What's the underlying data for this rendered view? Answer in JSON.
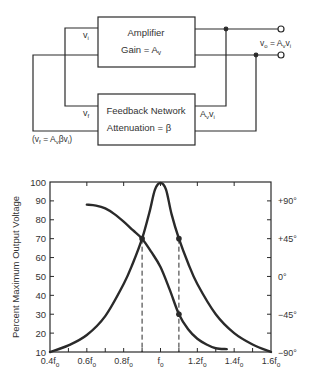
{
  "diagram": {
    "amplifier": {
      "title": "Amplifier",
      "subtitle_main": "Gain = A",
      "subtitle_sub": "v"
    },
    "feedback": {
      "title": "Feedback Network",
      "subtitle": "Attenuation = β"
    },
    "labels": {
      "vi": {
        "main": "v",
        "sub": "i"
      },
      "vf": {
        "main": "v",
        "sub": "f"
      },
      "output_parts": [
        "v",
        "o",
        " = A",
        "v",
        "v",
        "i"
      ],
      "feedback_output_parts": [
        "A",
        "v",
        "v",
        "i"
      ],
      "feedback_eq_parts": [
        "(v",
        "f",
        " = A",
        "v",
        "βv",
        "i",
        ")"
      ]
    }
  },
  "chart_data": {
    "type": "line",
    "title": "",
    "xlabel": "",
    "ylabel": "Percent Maximum Output Voltage",
    "y2label": "Phase",
    "categories": [
      "0.4f0",
      "0.6f0",
      "0.8f0",
      "f0",
      "1.2f0",
      "1.4f0",
      "1.6f0"
    ],
    "x_tick_labels": [
      {
        "main": "0.4f",
        "sub": "o"
      },
      {
        "main": "0.6f",
        "sub": "o"
      },
      {
        "main": "0.8f",
        "sub": "o"
      },
      {
        "main": "f",
        "sub": "o"
      },
      {
        "main": "1.2f",
        "sub": "o"
      },
      {
        "main": "1.4f",
        "sub": "o"
      },
      {
        "main": "1.6f",
        "sub": "o"
      }
    ],
    "x_ticks": [
      0.4,
      0.6,
      0.8,
      1.0,
      1.2,
      1.4,
      1.6
    ],
    "xlim": [
      0.4,
      1.6
    ],
    "ylim": [
      10,
      100
    ],
    "y_ticks": [
      10,
      20,
      30,
      40,
      50,
      60,
      70,
      80,
      90,
      100
    ],
    "y2_ticks": [
      {
        "value": 90,
        "label": "+90°"
      },
      {
        "value": 70,
        "label": "+45°"
      },
      {
        "value": 50,
        "label": "0°"
      },
      {
        "value": 30,
        "label": "−45°"
      },
      {
        "value": 10,
        "label": "−90°"
      }
    ],
    "grid": false,
    "series": [
      {
        "name": "Amplitude (% max output voltage)",
        "x": [
          0.4,
          0.5,
          0.6,
          0.7,
          0.8,
          0.85,
          0.9,
          0.94,
          0.97,
          1.0,
          1.03,
          1.06,
          1.1,
          1.15,
          1.2,
          1.3,
          1.4,
          1.5,
          1.6
        ],
        "values": [
          10,
          13.5,
          19,
          29,
          46,
          57,
          70,
          84,
          96,
          99.5,
          96,
          83,
          70,
          57,
          46,
          30,
          20,
          14,
          10
        ]
      },
      {
        "name": "Phase angle",
        "x": [
          0.6,
          0.65,
          0.7,
          0.75,
          0.8,
          0.85,
          0.9,
          0.95,
          1.0,
          1.05,
          1.1,
          1.15,
          1.2,
          1.25,
          1.3,
          1.36
        ],
        "values": [
          88,
          87.5,
          86,
          83,
          79,
          74.5,
          70,
          63,
          55,
          43,
          30,
          22,
          17,
          14,
          12,
          11.5
        ]
      }
    ],
    "markers": [
      {
        "x": 0.9,
        "y": 70
      },
      {
        "x": 1.1,
        "y": 70
      },
      {
        "x": 1.1,
        "y": 30
      }
    ],
    "dashed_verticals": [
      0.9,
      1.1
    ],
    "legend": null
  }
}
